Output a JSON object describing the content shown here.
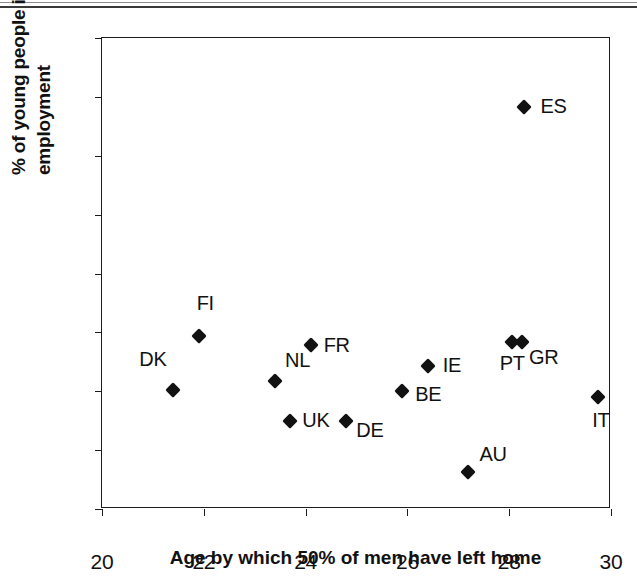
{
  "chart_data": {
    "type": "scatter",
    "title": "",
    "xlabel": "Age by which 50% of men have left home",
    "ylabel_line1": "% of young people in insecure",
    "ylabel_line2": "employment",
    "ylabel": "% of young people in insecure employment",
    "xlim": [
      20,
      30
    ],
    "ylim": [
      10,
      90
    ],
    "xticks": [
      "20",
      "22",
      "24",
      "26",
      "28",
      "30"
    ],
    "xtick_values": [
      20,
      22,
      24,
      26,
      28,
      30
    ],
    "yticks": [
      "10",
      "20",
      "30",
      "40",
      "50",
      "60",
      "70",
      "80",
      "90"
    ],
    "ytick_values": [
      10,
      20,
      30,
      40,
      50,
      60,
      70,
      80,
      90
    ],
    "grid": false,
    "legend": "none",
    "marker_shape": "diamond",
    "marker_color": "#111111",
    "points": [
      {
        "label": "DK",
        "x": 21.4,
        "y": 30.2,
        "label_dx": -34,
        "label_dy": -30
      },
      {
        "label": "FI",
        "x": 21.9,
        "y": 39.3,
        "label_dx": -2,
        "label_dy": -32
      },
      {
        "label": "NL",
        "x": 23.4,
        "y": 31.8,
        "label_dx": 10,
        "label_dy": -20
      },
      {
        "label": "UK",
        "x": 23.7,
        "y": 25.0,
        "label_dx": 12,
        "label_dy": 0
      },
      {
        "label": "FR",
        "x": 24.1,
        "y": 37.9,
        "label_dx": 13,
        "label_dy": 1
      },
      {
        "label": "DE",
        "x": 24.8,
        "y": 25.0,
        "label_dx": 10,
        "label_dy": 10
      },
      {
        "label": "BE",
        "x": 25.9,
        "y": 30.1,
        "label_dx": 13,
        "label_dy": 4
      },
      {
        "label": "IE",
        "x": 26.4,
        "y": 34.3,
        "label_dx": 15,
        "label_dy": 0
      },
      {
        "label": "AU",
        "x": 27.2,
        "y": 16.3,
        "label_dx": 11,
        "label_dy": -17
      },
      {
        "label": "PT",
        "x": 28.05,
        "y": 38.3,
        "label_dx": -12,
        "label_dy": 22
      },
      {
        "label": "GR",
        "x": 28.25,
        "y": 38.3,
        "label_dx": 7,
        "label_dy": 16
      },
      {
        "label": "ES",
        "x": 28.3,
        "y": 78.3,
        "label_dx": 16,
        "label_dy": 0
      },
      {
        "label": "IT",
        "x": 29.75,
        "y": 29.0,
        "label_dx": -6,
        "label_dy": 24
      }
    ]
  }
}
